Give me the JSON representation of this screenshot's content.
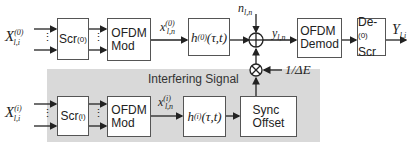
{
  "diagram": {
    "region_label": "Interfering Signal",
    "top_chain": {
      "input": {
        "base": "X",
        "sub": "l,i",
        "sup": "(0)"
      },
      "scrambler": {
        "label": "Scr",
        "sup": "(0)"
      },
      "modulator": {
        "line1": "OFDM",
        "line2": "Mod"
      },
      "mod_output": {
        "base": "x",
        "sub": "l,n",
        "sup": "(0)"
      },
      "channel": {
        "base": "h",
        "sup": "(0)",
        "arg": "(τ,t)"
      },
      "noise": {
        "base": "n",
        "sub": "l,n"
      },
      "adder_symbol": "⊕",
      "received": {
        "base": "y",
        "sub": "l,n"
      },
      "demodulator": {
        "line1": "OFDM",
        "line2": "Demod"
      },
      "descrambler": {
        "line1": "De-",
        "line2": "Scr",
        "sup": "(0)"
      },
      "output": {
        "base": "Y",
        "sub": "l,i"
      }
    },
    "bottom_chain": {
      "input": {
        "base": "X",
        "sub": "l,i",
        "sup": "(i)"
      },
      "scrambler": {
        "label": "Scr",
        "sup": "(i)"
      },
      "modulator": {
        "line1": "OFDM",
        "line2": "Mod"
      },
      "mod_output": {
        "base": "x",
        "sub": "l,n",
        "sup": "(i)"
      },
      "channel": {
        "base": "h",
        "sup": "(i)",
        "arg": "(τ,t)"
      },
      "sync": {
        "line1": "Sync",
        "line2": "Offset"
      },
      "multiplier_symbol": "⊗",
      "gain": "1/ΔE"
    },
    "ellipsis": "⋮"
  }
}
